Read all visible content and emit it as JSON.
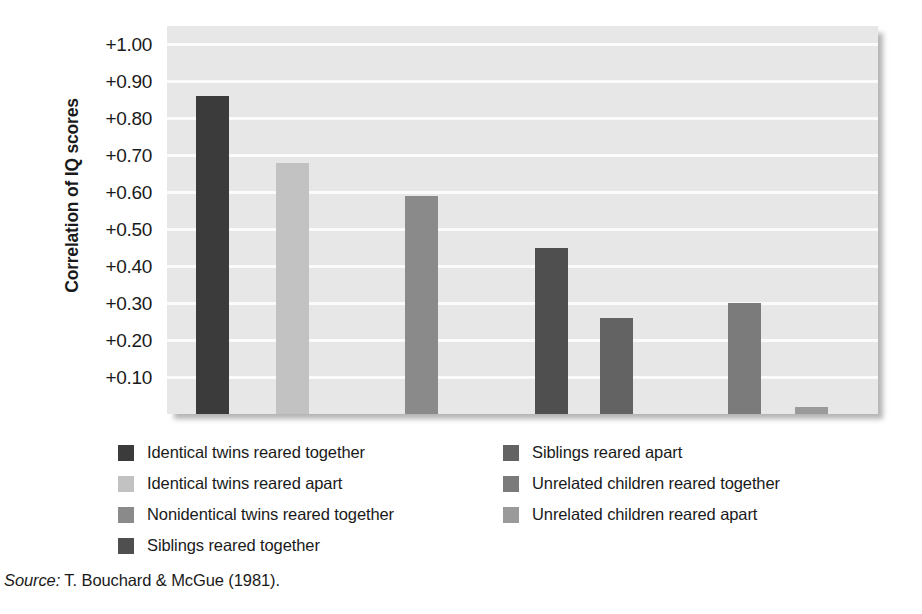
{
  "chart_data": {
    "type": "bar",
    "title": "",
    "subtitle": "",
    "xlabel": "",
    "ylabel": "Correlation of IQ scores",
    "ylim": [
      0,
      1.05
    ],
    "grid": true,
    "legend_position": "below",
    "categories": [
      "Identical twins reared together",
      "Identical twins reared apart",
      "Nonidentical twins reared together",
      "Siblings reared together",
      "Siblings reared apart",
      "Unrelated children reared together",
      "Unrelated children reared apart"
    ],
    "values": [
      0.86,
      0.68,
      0.59,
      0.45,
      0.26,
      0.3,
      0.02
    ],
    "bar_colors": [
      "#3b3b3b",
      "#c2c2c2",
      "#8a8a8a",
      "#4f4f4f",
      "#636363",
      "#7b7b7b",
      "#9a9a9a"
    ],
    "ytick_labels": [
      "+1.00",
      "+0.90",
      "+0.80",
      "+0.70",
      "+0.60",
      "+0.50",
      "+0.40",
      "+0.30",
      "+0.20",
      "+0.10"
    ],
    "ytick_values": [
      1.0,
      0.9,
      0.8,
      0.7,
      0.6,
      0.5,
      0.4,
      0.3,
      0.2,
      0.1
    ],
    "plot_background": "#e7e7e7",
    "gridline_color": "#fbfbfb"
  },
  "legend": {
    "left_column": [
      {
        "label": "Identical twins reared together",
        "color": "#3b3b3b"
      },
      {
        "label": "Identical twins reared apart",
        "color": "#c2c2c2"
      },
      {
        "label": "Nonidentical twins reared together",
        "color": "#8a8a8a"
      },
      {
        "label": "Siblings reared together",
        "color": "#4f4f4f"
      }
    ],
    "right_column": [
      {
        "label": "Siblings reared apart",
        "color": "#636363"
      },
      {
        "label": "Unrelated children reared together",
        "color": "#7b7b7b"
      },
      {
        "label": "Unrelated children reared apart",
        "color": "#9a9a9a"
      }
    ]
  },
  "source": {
    "prefix": "Source:",
    "text": "T. Bouchard & McGue (1981)."
  }
}
